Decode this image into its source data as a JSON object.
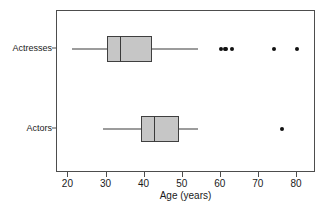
{
  "chart_data": {
    "type": "box",
    "title": "",
    "xlabel": "Age (years)",
    "ylabel": "",
    "xlim": [
      17,
      85
    ],
    "xticks": [
      20,
      30,
      40,
      50,
      60,
      70,
      80
    ],
    "xtick_labels": [
      "20",
      "30",
      "40",
      "50",
      "60",
      "70",
      "80"
    ],
    "grid": false,
    "legend": "none",
    "orientation": "horizontal",
    "categories": [
      "Actresses",
      "Actors"
    ],
    "box_fill_color": "#c6c6c6",
    "line_color": "#3a3a3a",
    "outlier_color": "#111111",
    "frame_color": "#4d4d4d",
    "boxes": [
      {
        "category": "Actresses",
        "whisker_low": 21,
        "q1": 30,
        "median": 33.5,
        "q3": 42,
        "whisker_high": 54,
        "outliers": [
          60,
          61,
          61.5,
          63,
          74,
          80
        ]
      },
      {
        "category": "Actors",
        "whisker_low": 29,
        "q1": 39,
        "median": 42.5,
        "q3": 49,
        "whisker_high": 54,
        "outliers": [
          76
        ]
      }
    ]
  },
  "axis_labels": {
    "x_title": "Age (years)",
    "cat_actresses": "Actresses",
    "cat_actors": "Actors"
  },
  "clipped_title": ""
}
